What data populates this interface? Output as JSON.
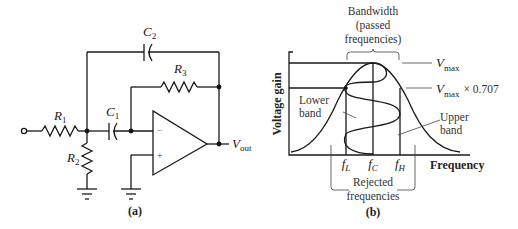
{
  "figure_a": {
    "caption": "(a)",
    "components": {
      "R1": {
        "name": "R",
        "sub": "1"
      },
      "R2": {
        "name": "R",
        "sub": "2"
      },
      "R3": {
        "name": "R",
        "sub": "3"
      },
      "C1": {
        "name": "C",
        "sub": "1"
      },
      "C2": {
        "name": "C",
        "sub": "2"
      }
    },
    "opamp": {
      "inverting": "−",
      "noninverting": "+"
    },
    "output": {
      "name": "V",
      "sub": "out"
    }
  },
  "figure_b": {
    "caption": "(b)",
    "ylabel": "Voltage gain",
    "xlabel": "Frequency",
    "bandwidth_label": [
      "Bandwidth",
      "(passed",
      "frequencies)"
    ],
    "rejected_label": [
      "Rejected",
      "frequencies"
    ],
    "lower_band_label": [
      "Lower",
      "band"
    ],
    "upper_band_label": [
      "Upper",
      "band"
    ],
    "vmax": {
      "name": "V",
      "sub": "max"
    },
    "vmax707": {
      "name": "V",
      "sub": "max",
      "suffix": "× 0.707"
    },
    "ticks": {
      "fL": {
        "name": "f",
        "sub": "L"
      },
      "fC": {
        "name": "f",
        "sub": "C"
      },
      "fH": {
        "name": "f",
        "sub": "H"
      }
    }
  }
}
